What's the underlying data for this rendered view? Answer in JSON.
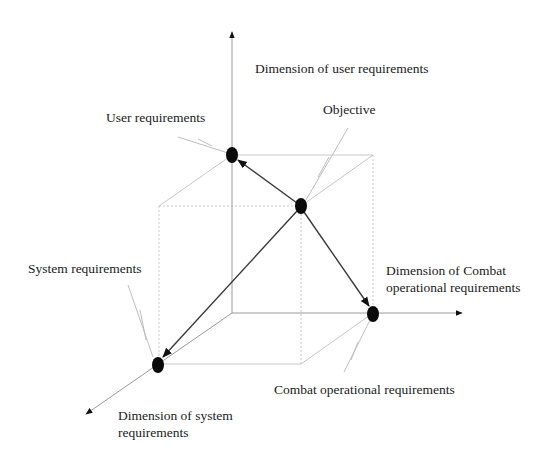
{
  "diagram": {
    "type": "3d-requirements-space",
    "axes": {
      "vertical": {
        "label": "Dimension of user requirements"
      },
      "horizontal": {
        "label_line1": "Dimension of Combat",
        "label_line2": "operational requirements"
      },
      "depth": {
        "label_line1": "Dimension of system",
        "label_line2": "requirements"
      }
    },
    "nodes": {
      "objective": {
        "label": "Objective"
      },
      "user": {
        "label": "User requirements"
      },
      "combat": {
        "label": "Combat operational requirements"
      },
      "system": {
        "label": "System requirements"
      }
    },
    "edges": [
      {
        "from": "objective",
        "to": "user"
      },
      {
        "from": "objective",
        "to": "combat"
      },
      {
        "from": "objective",
        "to": "system"
      }
    ],
    "colors": {
      "node": "#0a0a0a",
      "vector": "#3a3a3a",
      "axis": "#9a9a9a",
      "cube": "#c8c8c8",
      "text": "#1a1a1a"
    }
  }
}
